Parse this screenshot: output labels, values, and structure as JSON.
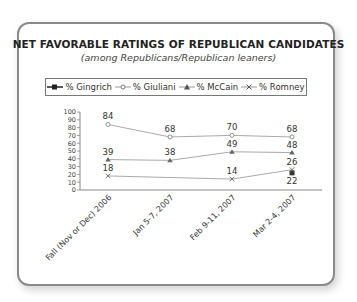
{
  "title": "NET FAVORABLE RATINGS OF REPUBLICAN CANDIDATES",
  "subtitle": "(among Republicans/Republican leaners)",
  "legend": [
    {
      "label": "% Gingrich",
      "marker": "square"
    },
    {
      "label": "% Giuliani",
      "marker": "diamond"
    },
    {
      "label": "% McCain",
      "marker": "triangle"
    },
    {
      "label": "% Romney",
      "marker": "x"
    }
  ],
  "chart_data": {
    "type": "line",
    "title": "NET FAVORABLE RATINGS OF REPUBLICAN CANDIDATES",
    "subtitle": "(among Republicans/Republican leaners)",
    "xlabel": "",
    "ylabel": "",
    "ylim": [
      0,
      100
    ],
    "yticks": [
      0,
      10,
      20,
      30,
      40,
      50,
      60,
      70,
      80,
      90,
      100
    ],
    "categories": [
      "Fall (Nov or Dec) 2006",
      "Jan 5-7, 2007",
      "Feb 9-11, 2007",
      "Mar 2-4, 2007"
    ],
    "series": [
      {
        "name": "% Gingrich",
        "values": [
          null,
          null,
          null,
          22
        ]
      },
      {
        "name": "% Giuliani",
        "values": [
          84,
          68,
          70,
          68
        ]
      },
      {
        "name": "% McCain",
        "values": [
          39,
          38,
          49,
          48
        ]
      },
      {
        "name": "% Romney",
        "values": [
          18,
          null,
          14,
          26
        ]
      }
    ],
    "legend_position": "top",
    "grid": false,
    "data_labels": true
  }
}
